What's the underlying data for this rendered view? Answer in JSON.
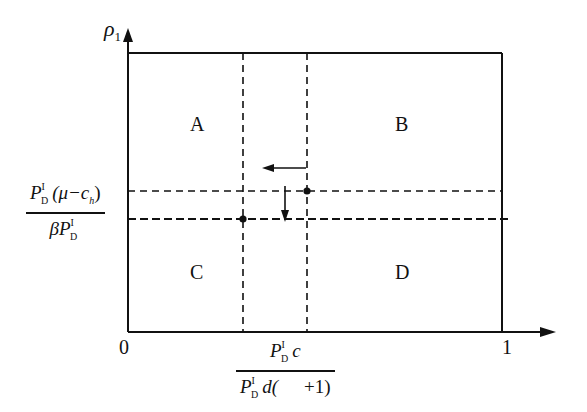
{
  "diagram": {
    "y_axis_label": "ρ",
    "y_axis_subscript": "1",
    "x_ticks": {
      "origin": "0",
      "right": "1"
    },
    "regions": {
      "A": "A",
      "B": "B",
      "C": "C",
      "D": "D"
    },
    "y_threshold_label": {
      "numerator_P": "P",
      "numerator_sup": "I",
      "numerator_sub": "D",
      "numerator_rest": "(μ−c",
      "numerator_rest_sub": "h",
      "numerator_close": ")",
      "denominator_prefix": "β",
      "denominator_P": "P",
      "denominator_sup": "I",
      "denominator_sub": "D"
    },
    "x_threshold_label": {
      "numerator_P": "P",
      "numerator_sup": "I",
      "numerator_sub": "D",
      "numerator_rest": "c",
      "denominator_P": "P",
      "denominator_sup": "I",
      "denominator_sub": "D",
      "denominator_rest": "d(",
      "denominator_tail": "+1)"
    },
    "colors": {
      "line": "#111111",
      "background": "#ffffff"
    }
  }
}
